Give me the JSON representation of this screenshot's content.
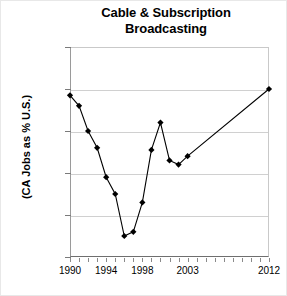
{
  "chart_data": {
    "type": "line",
    "title": "Cable & Subscription Broadcasting",
    "title_lines": [
      "Cable & Subscription",
      "Broadcasting"
    ],
    "xlabel": "",
    "ylabel": "(CA Jobs as % U.S.)",
    "ylim": [
      9,
      14
    ],
    "xlim": [
      1990,
      2012
    ],
    "grid": true,
    "legend": null,
    "y_tick_labels": [
      "14%",
      "13%",
      "12%",
      "11%",
      "10%",
      "9%"
    ],
    "y_ticks": [
      14,
      13,
      12,
      11,
      10,
      9
    ],
    "x_tick_labels": [
      "1990",
      "1994",
      "1998",
      "2003",
      "2012"
    ],
    "x_tick_values": [
      1990,
      1994,
      1998,
      2003,
      2012
    ],
    "marker": "diamond",
    "line_color": "#000000",
    "marker_color": "#000000",
    "x": [
      1990,
      1991,
      1992,
      1993,
      1994,
      1995,
      1996,
      1997,
      1998,
      1999,
      2000,
      2001,
      2002,
      2003,
      2012
    ],
    "values": [
      12.85,
      12.6,
      12.0,
      11.6,
      10.9,
      10.5,
      9.5,
      9.6,
      10.3,
      11.55,
      12.2,
      11.3,
      11.2,
      11.4,
      13.0
    ],
    "series": [
      {
        "name": "CA Jobs as % U.S.",
        "values": [
          12.85,
          12.6,
          12.0,
          11.6,
          10.9,
          10.5,
          9.5,
          9.6,
          10.3,
          11.55,
          12.2,
          11.3,
          11.2,
          11.4,
          13.0
        ]
      }
    ]
  }
}
